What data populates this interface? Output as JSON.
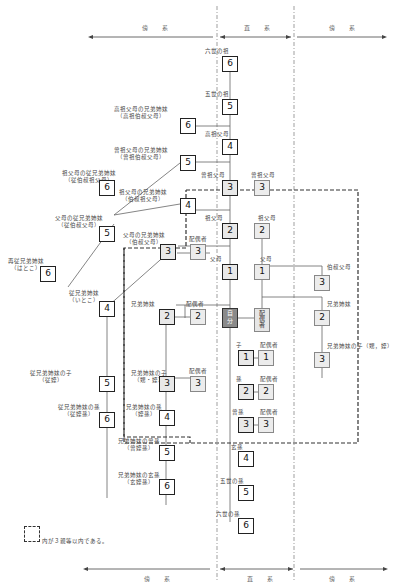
{
  "header": {
    "left_label": "傍　系",
    "center_label": "直　系",
    "right_label": "傍　系"
  },
  "footer": {
    "left_label": "傍　系",
    "center_label": "直　系",
    "right_label": "傍　系"
  },
  "legend": {
    "text": "内が３親等以内である。"
  },
  "direct_line": {
    "ancestors": [
      {
        "label": "六世の祖",
        "degree": "6"
      },
      {
        "label": "五世の祖",
        "degree": "5"
      },
      {
        "label": "高祖父母",
        "degree": "4"
      },
      {
        "label": "曾祖父母",
        "degree": "3"
      },
      {
        "label": "祖父母",
        "degree": "2"
      },
      {
        "label": "父母",
        "degree": "1"
      }
    ],
    "self": {
      "label": "自分",
      "line1": "自",
      "line2": "分"
    },
    "descendants": [
      {
        "label": "子",
        "degree": "1"
      },
      {
        "label": "孫",
        "degree": "2"
      },
      {
        "label": "曾孫",
        "degree": "3"
      },
      {
        "label": "玄孫",
        "degree": "4"
      },
      {
        "label": "五世の孫",
        "degree": "5"
      },
      {
        "label": "六世の孫",
        "degree": "6"
      }
    ]
  },
  "spouse_side": {
    "spouse": {
      "label": "配偶者",
      "line1": "配",
      "line2": "偶",
      "line3": "者"
    },
    "ancestors": [
      {
        "label": "曾祖父母",
        "degree": "3"
      },
      {
        "label": "祖父母",
        "degree": "2"
      },
      {
        "label": "父母",
        "degree": "1"
      }
    ],
    "uncle": {
      "label": "伯叔父母",
      "degree": "3"
    },
    "sibling": {
      "label": "兄弟姉妹",
      "degree": "2"
    },
    "sibling_child": {
      "label": "兄弟姉妹の子（甥，姪）",
      "degree": "3"
    }
  },
  "descendant_spouses": [
    {
      "label": "配偶者",
      "degree": "1"
    },
    {
      "label": "配偶者",
      "degree": "2"
    },
    {
      "label": "配偶者",
      "degree": "3"
    }
  ],
  "collateral": {
    "great_great_grand_uncle": {
      "label1": "高祖父母の兄弟姉妹",
      "label2": "（高祖伯叔父母）",
      "degree": "6"
    },
    "great_grand_uncle": {
      "label1": "曾祖父母の兄弟姉妹",
      "label2": "（曾祖伯叔父母）",
      "degree": "5"
    },
    "grand_parent_cousin": {
      "label1": "祖父母の従兄弟姉妹",
      "label2": "（従伯叔祖父母）",
      "degree": "6"
    },
    "grand_uncle": {
      "label1": "祖父母の兄弟姉妹",
      "label2": "（伯叔祖父母）",
      "degree": "4"
    },
    "parent_cousin": {
      "label1": "父母の従兄弟姉妹",
      "label2": "（従伯叔父母）",
      "degree": "5"
    },
    "second_cousin": {
      "label1": "再従兄弟姉妹",
      "label2": "（はとこ）",
      "degree": "6"
    },
    "uncle": {
      "label1": "父母の兄弟姉妹",
      "label2": "（伯叔父母）",
      "degree": "3"
    },
    "uncle_spouse": {
      "label": "配偶者",
      "degree": "3"
    },
    "cousin": {
      "label1": "従兄弟姉妹",
      "label2": "（いとこ）",
      "degree": "4"
    },
    "sibling": {
      "label": "兄弟姉妹",
      "degree": "2"
    },
    "sibling_spouse": {
      "label": "配偶者",
      "degree": "2"
    },
    "cousin_child": {
      "label1": "従兄弟姉妹の子",
      "label2": "（従姪）",
      "degree": "5"
    },
    "sibling_child": {
      "label1": "兄弟姉妹の子",
      "label2": "（甥・姪）",
      "degree": "3"
    },
    "sibling_child_spouse": {
      "label": "配偶者",
      "degree": "3"
    },
    "cousin_grandchild": {
      "label1": "従兄弟姉妹の孫",
      "label2": "（従姪孫）",
      "degree": "6"
    },
    "sibling_grandchild": {
      "label1": "兄弟姉妹の孫",
      "label2": "（姪孫）",
      "degree": "4"
    },
    "sibling_great_grandchild": {
      "label1": "兄弟姉妹の曾孫",
      "label2": "（曾姪孫）",
      "degree": "5"
    },
    "sibling_great_great_grandchild": {
      "label1": "兄弟姉妹の玄孫",
      "label2": "（玄姪孫）",
      "degree": "6"
    }
  }
}
